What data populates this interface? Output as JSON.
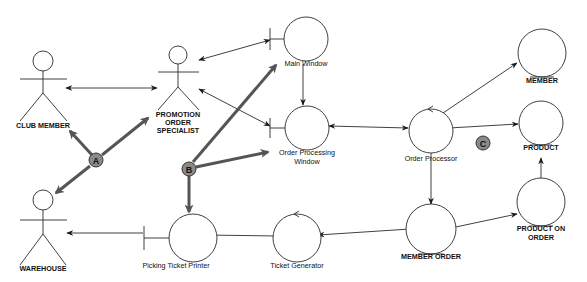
{
  "diagram": {
    "type": "UML robustness diagram",
    "actors": [
      {
        "id": "club_member",
        "label_lines": [
          "CLUB MEMBER"
        ]
      },
      {
        "id": "promotion_order_specialist",
        "label_lines": [
          "PROMOTION",
          "ORDER",
          "SPECIALIST"
        ]
      },
      {
        "id": "warehouse",
        "label_lines": [
          "WAREHOUSE"
        ]
      }
    ],
    "boundaries": [
      {
        "id": "main_window",
        "label_lines": [
          "Main Window"
        ]
      },
      {
        "id": "order_processing_window",
        "label_lines": [
          "Order Processing",
          "Window"
        ]
      },
      {
        "id": "picking_ticket_printer",
        "label_lines": [
          "Picking Ticket Printer"
        ]
      }
    ],
    "controls": [
      {
        "id": "order_processor",
        "label_lines": [
          "Order Processor"
        ]
      },
      {
        "id": "ticket_generator",
        "label_lines": [
          "Ticket Generator"
        ]
      }
    ],
    "entities": [
      {
        "id": "member",
        "label_lines": [
          "MEMBER"
        ]
      },
      {
        "id": "product",
        "label_lines": [
          "PRODUCT"
        ]
      },
      {
        "id": "product_on_order",
        "label_lines": [
          "PRODUCT ON",
          "ORDER"
        ]
      },
      {
        "id": "member_order",
        "label_lines": [
          "MEMBER ORDER"
        ]
      }
    ],
    "connections": [
      {
        "from": "club_member",
        "to": "promotion_order_specialist",
        "direction": "both"
      },
      {
        "from": "promotion_order_specialist",
        "to": "main_window",
        "direction": "both"
      },
      {
        "from": "promotion_order_specialist",
        "to": "order_processing_window",
        "direction": "both"
      },
      {
        "from": "main_window",
        "to": "order_processing_window",
        "direction": "forward"
      },
      {
        "from": "order_processing_window",
        "to": "order_processor",
        "direction": "both"
      },
      {
        "from": "order_processor",
        "to": "member",
        "direction": "forward"
      },
      {
        "from": "order_processor",
        "to": "product",
        "direction": "forward"
      },
      {
        "from": "order_processor",
        "to": "member_order",
        "direction": "forward"
      },
      {
        "from": "member_order",
        "to": "product_on_order",
        "direction": "forward"
      },
      {
        "from": "product_on_order",
        "to": "product",
        "direction": "forward"
      },
      {
        "from": "member_order",
        "to": "ticket_generator",
        "direction": "forward"
      },
      {
        "from": "ticket_generator",
        "to": "picking_ticket_printer",
        "direction": "forward"
      },
      {
        "from": "picking_ticket_printer",
        "to": "warehouse",
        "direction": "forward"
      }
    ],
    "callouts": [
      {
        "id": "A",
        "label": "A",
        "points_to": [
          "club_member",
          "promotion_order_specialist",
          "warehouse"
        ]
      },
      {
        "id": "B",
        "label": "B",
        "points_to": [
          "main_window",
          "order_processing_window",
          "picking_ticket_printer"
        ]
      },
      {
        "id": "C",
        "label": "C",
        "points_to": []
      }
    ]
  }
}
